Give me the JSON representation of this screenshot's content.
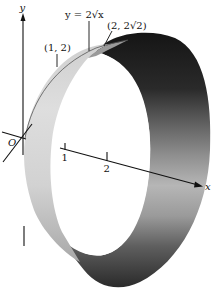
{
  "figure": {
    "type": "surface-of-revolution",
    "colors": {
      "background": "#ffffff",
      "ink": "#111111",
      "band_light": "#dcdcdc",
      "band_mid": "#8a8a8a",
      "band_dark": "#1e1e1e"
    }
  },
  "labels": {
    "y_axis": "y",
    "x_axis": "x",
    "origin": "O",
    "curve": "y = 2√x",
    "point_start": "(1, 2)",
    "point_end": "(2, 2√2)",
    "tick_1": "1",
    "tick_2": "2"
  }
}
